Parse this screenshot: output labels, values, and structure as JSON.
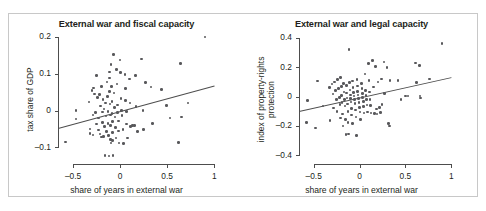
{
  "figure": {
    "border_color": "#c8c8c8",
    "background": "#ffffff",
    "point_color": "#58585b",
    "axis_color": "#4d4d4d"
  },
  "chart_data": [
    {
      "type": "scatter",
      "panel": "left",
      "title": "External war and fiscal capacity",
      "xlabel": "share of years in external war",
      "ylabel": "tax share of GDP",
      "xlim": [
        -0.66,
        1.04
      ],
      "ylim": [
        -0.145,
        0.205
      ],
      "xticks": [
        -0.5,
        0,
        0.5,
        1
      ],
      "xticklabels": [
        "–0.5",
        "0",
        "0.5",
        "1"
      ],
      "yticks": [
        -0.1,
        0,
        0.1,
        0.2
      ],
      "yticklabels": [
        "–0.1",
        "0",
        "0.1",
        "0.2"
      ],
      "grid": false,
      "legend": "none",
      "fit_line": {
        "x0": -0.66,
        "y0": -0.047,
        "x1": 1.0,
        "y1": 0.068
      },
      "points": [
        [
          -0.58,
          -0.085
        ],
        [
          -0.47,
          0.0
        ],
        [
          -0.47,
          -0.023
        ],
        [
          -0.33,
          0.023
        ],
        [
          -0.32,
          -0.05
        ],
        [
          -0.32,
          -0.062
        ],
        [
          -0.3,
          0.055
        ],
        [
          -0.29,
          -0.012
        ],
        [
          -0.29,
          -0.066
        ],
        [
          -0.28,
          0.061
        ],
        [
          -0.27,
          0.045
        ],
        [
          -0.26,
          -0.005
        ],
        [
          -0.25,
          0.095
        ],
        [
          -0.25,
          -0.037
        ],
        [
          -0.24,
          0.035
        ],
        [
          -0.23,
          -0.02
        ],
        [
          -0.23,
          -0.053
        ],
        [
          -0.22,
          0.043
        ],
        [
          -0.215,
          -0.064
        ],
        [
          -0.21,
          0.012
        ],
        [
          -0.2,
          -0.072
        ],
        [
          -0.195,
          0.065
        ],
        [
          -0.19,
          -0.004
        ],
        [
          -0.185,
          -0.032
        ],
        [
          -0.18,
          0.03
        ],
        [
          -0.175,
          -0.07
        ],
        [
          -0.17,
          0.004
        ],
        [
          -0.165,
          -0.043
        ],
        [
          -0.16,
          -0.122
        ],
        [
          -0.155,
          0.02
        ],
        [
          -0.15,
          -0.015
        ],
        [
          -0.145,
          -0.057
        ],
        [
          -0.14,
          0.077
        ],
        [
          -0.135,
          0.038
        ],
        [
          -0.13,
          -0.003
        ],
        [
          -0.128,
          -0.035
        ],
        [
          -0.125,
          -0.068
        ],
        [
          -0.12,
          -0.123
        ],
        [
          -0.115,
          0.105
        ],
        [
          -0.112,
          0.088
        ],
        [
          -0.11,
          0.052
        ],
        [
          -0.108,
          0.018
        ],
        [
          -0.105,
          -0.012
        ],
        [
          -0.102,
          -0.041
        ],
        [
          -0.1,
          -0.078
        ],
        [
          -0.098,
          -0.088
        ],
        [
          -0.095,
          0.125
        ],
        [
          -0.09,
          0.066
        ],
        [
          -0.088,
          0.024
        ],
        [
          -0.085,
          -0.008
        ],
        [
          -0.082,
          -0.03
        ],
        [
          -0.08,
          -0.06
        ],
        [
          -0.078,
          -0.082
        ],
        [
          -0.075,
          -0.122
        ],
        [
          -0.07,
          0.152
        ],
        [
          -0.065,
          0.048
        ],
        [
          -0.06,
          0.009
        ],
        [
          -0.055,
          -0.018
        ],
        [
          -0.05,
          -0.046
        ],
        [
          -0.045,
          -0.074
        ],
        [
          -0.04,
          0.112
        ],
        [
          -0.035,
          0.072
        ],
        [
          -0.03,
          0.015
        ],
        [
          -0.025,
          -0.006
        ],
        [
          -0.02,
          -0.028
        ],
        [
          -0.015,
          -0.055
        ],
        [
          -0.01,
          -0.088
        ],
        [
          0.0,
          0.137
        ],
        [
          0.005,
          0.104
        ],
        [
          0.01,
          0.033
        ],
        [
          0.015,
          0.0
        ],
        [
          0.02,
          -0.014
        ],
        [
          0.03,
          -0.052
        ],
        [
          0.035,
          -0.09
        ],
        [
          0.05,
          0.098
        ],
        [
          0.055,
          0.06
        ],
        [
          0.06,
          0.027
        ],
        [
          0.065,
          -0.002
        ],
        [
          0.07,
          -0.036
        ],
        [
          0.08,
          -0.075
        ],
        [
          0.1,
          0.086
        ],
        [
          0.105,
          0.021
        ],
        [
          0.11,
          -0.043
        ],
        [
          0.13,
          -0.04
        ],
        [
          0.15,
          -0.041
        ],
        [
          0.165,
          0.095
        ],
        [
          0.17,
          0.011
        ],
        [
          0.185,
          -0.057
        ],
        [
          0.23,
          0.14
        ],
        [
          0.245,
          0.0
        ],
        [
          0.25,
          -0.052
        ],
        [
          0.27,
          0.076
        ],
        [
          0.33,
          0.064
        ],
        [
          0.345,
          -0.035
        ],
        [
          0.44,
          0.057
        ],
        [
          0.49,
          0.013
        ],
        [
          0.53,
          -0.02
        ],
        [
          0.62,
          -0.086
        ],
        [
          0.64,
          0.128
        ],
        [
          0.655,
          -0.017
        ],
        [
          0.72,
          0.02
        ],
        [
          0.9,
          0.2
        ]
      ]
    },
    {
      "type": "scatter",
      "panel": "right",
      "title": "External war and legal capacity",
      "xlabel": "share of years in external war",
      "ylabel_line1": "index of property-rights",
      "ylabel_line2": "protection",
      "xlim": [
        -0.66,
        1.04
      ],
      "ylim": [
        -0.46,
        0.42
      ],
      "xticks": [
        -0.5,
        0,
        0.5,
        1
      ],
      "xticklabels": [
        "–0.5",
        "0",
        "0.5",
        "1"
      ],
      "yticks": [
        -0.4,
        -0.2,
        0,
        0.2,
        0.4
      ],
      "yticklabels": [
        "–0.4",
        "–0.2",
        "0",
        "0.2",
        "0.4"
      ],
      "grid": false,
      "legend": "none",
      "fit_line": {
        "x0": -0.66,
        "y0": -0.098,
        "x1": 1.0,
        "y1": 0.133
      },
      "points": [
        [
          -0.58,
          -0.175
        ],
        [
          -0.57,
          -0.028
        ],
        [
          -0.48,
          -0.215
        ],
        [
          -0.46,
          0.105
        ],
        [
          -0.4,
          -0.065
        ],
        [
          -0.33,
          0.06
        ],
        [
          -0.32,
          -0.165
        ],
        [
          -0.3,
          0.085
        ],
        [
          -0.29,
          0.018
        ],
        [
          -0.285,
          -0.078
        ],
        [
          -0.27,
          0.1
        ],
        [
          -0.26,
          0.04
        ],
        [
          -0.25,
          -0.022
        ],
        [
          -0.245,
          -0.1
        ],
        [
          -0.24,
          0.115
        ],
        [
          -0.23,
          0.055
        ],
        [
          -0.22,
          -0.005
        ],
        [
          -0.215,
          -0.055
        ],
        [
          -0.21,
          -0.145
        ],
        [
          -0.205,
          0.13
        ],
        [
          -0.2,
          0.068
        ],
        [
          -0.195,
          0.008
        ],
        [
          -0.19,
          -0.042
        ],
        [
          -0.185,
          -0.12
        ],
        [
          -0.18,
          -0.2
        ],
        [
          -0.175,
          0.09
        ],
        [
          -0.17,
          0.03
        ],
        [
          -0.165,
          -0.018
        ],
        [
          -0.16,
          -0.065
        ],
        [
          -0.155,
          -0.155
        ],
        [
          -0.15,
          -0.26
        ],
        [
          -0.145,
          0.075
        ],
        [
          -0.14,
          0.025
        ],
        [
          -0.135,
          -0.01
        ],
        [
          -0.13,
          -0.05
        ],
        [
          -0.128,
          -0.1
        ],
        [
          -0.125,
          -0.175
        ],
        [
          -0.12,
          -0.255
        ],
        [
          -0.115,
          0.32
        ],
        [
          -0.11,
          0.095
        ],
        [
          -0.105,
          0.045
        ],
        [
          -0.1,
          0.012
        ],
        [
          -0.098,
          -0.012
        ],
        [
          -0.095,
          -0.038
        ],
        [
          -0.09,
          -0.082
        ],
        [
          -0.085,
          -0.125
        ],
        [
          -0.08,
          -0.185
        ],
        [
          -0.075,
          0.105
        ],
        [
          -0.07,
          0.06
        ],
        [
          -0.065,
          0.028
        ],
        [
          -0.06,
          0.005
        ],
        [
          -0.055,
          -0.02
        ],
        [
          -0.05,
          -0.048
        ],
        [
          -0.045,
          -0.092
        ],
        [
          -0.04,
          -0.14
        ],
        [
          -0.035,
          -0.265
        ],
        [
          -0.03,
          0.118
        ],
        [
          -0.025,
          0.072
        ],
        [
          -0.02,
          0.035
        ],
        [
          -0.015,
          0.01
        ],
        [
          -0.01,
          -0.015
        ],
        [
          -0.005,
          -0.042
        ],
        [
          0.0,
          -0.075
        ],
        [
          0.005,
          -0.105
        ],
        [
          0.01,
          -0.155
        ],
        [
          0.02,
          0.09
        ],
        [
          0.025,
          0.055
        ],
        [
          0.03,
          0.022
        ],
        [
          0.035,
          -0.005
        ],
        [
          0.04,
          -0.032
        ],
        [
          0.045,
          -0.068
        ],
        [
          0.05,
          -0.112
        ],
        [
          0.06,
          0.155
        ],
        [
          0.065,
          0.04
        ],
        [
          0.07,
          0.008
        ],
        [
          0.075,
          -0.022
        ],
        [
          0.08,
          -0.058
        ],
        [
          0.085,
          -0.105
        ],
        [
          0.1,
          0.225
        ],
        [
          0.105,
          0.11
        ],
        [
          0.11,
          0.03
        ],
        [
          0.115,
          -0.02
        ],
        [
          0.12,
          -0.06
        ],
        [
          0.125,
          -0.112
        ],
        [
          0.14,
          0.245
        ],
        [
          0.15,
          0.065
        ],
        [
          0.16,
          -0.115
        ],
        [
          0.175,
          0.205
        ],
        [
          0.185,
          -0.085
        ],
        [
          0.19,
          -0.12
        ],
        [
          0.2,
          0.1
        ],
        [
          0.215,
          -0.075
        ],
        [
          0.225,
          -0.108
        ],
        [
          0.24,
          0.12
        ],
        [
          0.245,
          -0.055
        ],
        [
          0.265,
          0.235
        ],
        [
          0.27,
          0.02
        ],
        [
          0.3,
          0.2
        ],
        [
          0.315,
          -0.185
        ],
        [
          0.325,
          -0.2
        ],
        [
          0.33,
          0.108
        ],
        [
          0.42,
          0.11
        ],
        [
          0.45,
          -0.018
        ],
        [
          0.5,
          0.005
        ],
        [
          0.53,
          0.005
        ],
        [
          0.61,
          0.228
        ],
        [
          0.62,
          0.095
        ],
        [
          0.655,
          0.21
        ],
        [
          0.66,
          0.005
        ],
        [
          0.665,
          -0.01
        ],
        [
          0.76,
          0.12
        ],
        [
          0.9,
          0.36
        ]
      ]
    }
  ]
}
